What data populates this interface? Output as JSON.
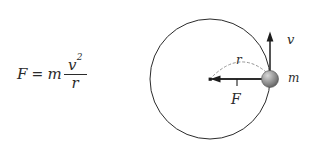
{
  "figure": {
    "type": "physics-diagram",
    "background_color": "#ffffff",
    "ink_color": "#2b2b2b",
    "width": 310,
    "height": 162
  },
  "formula": {
    "lhs": "F",
    "equals": "=",
    "mass": "m",
    "numerator": "v",
    "numerator_exponent": "2",
    "denominator": "r",
    "plain_text": "F = m v^2 / r"
  },
  "diagram": {
    "circle": {
      "center_x": 210,
      "center_y": 79,
      "radius": 60,
      "stroke_color": "#2b2b2b",
      "stroke_width": 1
    },
    "center_marker": {
      "x": 210,
      "y": 79,
      "shape": "square-dot",
      "size": 3
    },
    "mass_body": {
      "label": "m",
      "x": 270,
      "y": 79,
      "radius": 8.5,
      "fill_highlight": "#cfcfcf",
      "fill_mid": "#8c8c8c",
      "fill_shadow": "#5a5a5a"
    },
    "radius_line": {
      "from_x": 210,
      "from_y": 79,
      "to_x": 270,
      "to_y": 79
    },
    "force_arrow": {
      "label": "F",
      "direction": "left",
      "tail_x": 268,
      "tail_y": 79,
      "head_x": 211,
      "head_y": 79,
      "meaning": "centripetal force toward center"
    },
    "velocity_arrow": {
      "label": "v",
      "direction": "up",
      "tail_x": 270,
      "tail_y": 79,
      "head_x": 270,
      "head_y": 33,
      "meaning": "tangential velocity"
    },
    "radius_arc": {
      "label": "r",
      "style": "dashed",
      "from_x": 212,
      "from_y": 76,
      "to_x": 266,
      "to_y": 72,
      "apex_x": 240,
      "apex_y": 59
    },
    "labels": {
      "r": "r",
      "F": "F",
      "v": "v",
      "m": "m"
    }
  }
}
